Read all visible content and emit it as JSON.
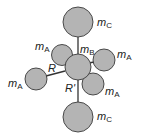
{
  "diagram": {
    "title": "",
    "colors": {
      "atom_fill": "#b4b4b4",
      "atom_stroke": "#3a3a3a",
      "bond": "#333333",
      "text": "#222222"
    },
    "labels": {
      "top_c": {
        "main": "m",
        "sub": "C"
      },
      "bottom_c": {
        "main": "m",
        "sub": "C"
      },
      "center_b": {
        "main": "m",
        "sub": "B"
      },
      "upper_left_a": {
        "main": "m",
        "sub": "A"
      },
      "right_a": {
        "main": "m",
        "sub": "A"
      },
      "left_a": {
        "main": "m",
        "sub": "A"
      },
      "lower_right_a": {
        "main": "m",
        "sub": "A"
      },
      "bond_r": "R",
      "bond_r_prime": "R'"
    }
  }
}
